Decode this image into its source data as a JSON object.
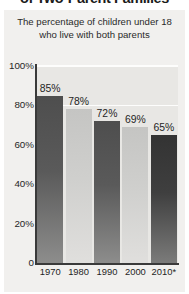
{
  "headline": "of Two-Parent Families",
  "subtitle": "The percentage of children under 18 who live with both parents",
  "chart_data": {
    "type": "bar",
    "title": "of Two-Parent Families",
    "subtitle": "The percentage of children under 18 who live with both parents",
    "categories": [
      "1970",
      "1980",
      "1990",
      "2000",
      "2010*"
    ],
    "values": [
      85,
      78,
      72,
      69,
      65
    ],
    "value_labels": [
      "85%",
      "78%",
      "72%",
      "69%",
      "65%"
    ],
    "xlabel": "",
    "ylabel": "",
    "ylim": [
      0,
      100
    ],
    "yticks": [
      0,
      20,
      40,
      60,
      80,
      100
    ],
    "ytick_labels": [
      "0",
      "20%",
      "40%",
      "60%",
      "80%",
      "100%"
    ],
    "grid": true,
    "gridlines_at": [
      80,
      100
    ],
    "legend": "none",
    "bar_shades": [
      "dark",
      "light",
      "dark",
      "light",
      "darkest"
    ],
    "colors": {
      "bar_dark": "#565656",
      "bar_light": "#cbcbc9",
      "bar_darkest": "#3a3a3a",
      "plot_background": "#e8e7e4",
      "panel_background": "#f1f0ee",
      "gridline": "#fdfdfc",
      "axis": "#3a3a3a",
      "text": "#1f1f1f"
    }
  }
}
